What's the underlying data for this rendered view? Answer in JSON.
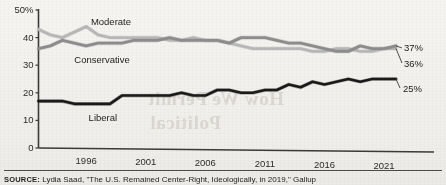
{
  "chart_data": {
    "type": "line",
    "title": "",
    "subtitle": "",
    "xlabel": "",
    "ylabel": "",
    "xlim": [
      1992,
      2022
    ],
    "ylim": [
      0,
      50
    ],
    "grid": false,
    "legend_position": "inline-annotations",
    "y_ticks": [
      "50%",
      "40",
      "30",
      "20",
      "10",
      "0"
    ],
    "y_tick_values": [
      50,
      40,
      30,
      20,
      10,
      0
    ],
    "x_ticks": [
      "1996",
      "2001",
      "2006",
      "2011",
      "2016",
      "2021"
    ],
    "x_tick_values": [
      1996,
      2001,
      2006,
      2011,
      2016,
      2021
    ],
    "x": [
      1992,
      1993,
      1994,
      1995,
      1996,
      1997,
      1998,
      1999,
      2000,
      2001,
      2002,
      2003,
      2004,
      2005,
      2006,
      2007,
      2008,
      2009,
      2010,
      2011,
      2012,
      2013,
      2014,
      2015,
      2016,
      2017,
      2018,
      2019,
      2020,
      2021,
      2022
    ],
    "series": [
      {
        "name": "Moderate",
        "color": "#b7b7b7",
        "end_label": "36%",
        "label_x": 1996.4,
        "label_y": 45.5,
        "values": [
          43,
          41,
          40,
          42,
          44,
          41,
          40,
          40,
          40,
          40,
          40,
          39,
          39,
          40,
          39,
          39,
          38,
          37,
          36,
          36,
          36,
          36,
          36,
          35,
          35,
          36,
          36,
          35,
          35,
          36,
          36
        ]
      },
      {
        "name": "Conservative",
        "color": "#8c8c8c",
        "end_label": "37%",
        "label_x": 1995.0,
        "label_y": 32.0,
        "values": [
          36,
          37,
          39,
          38,
          37,
          38,
          38,
          38,
          39,
          39,
          39,
          40,
          39,
          39,
          39,
          39,
          38,
          40,
          40,
          40,
          39,
          38,
          38,
          37,
          36,
          35,
          35,
          37,
          36,
          36,
          37
        ]
      },
      {
        "name": "Liberal",
        "color": "#1a1a1a",
        "end_label": "25%",
        "label_x": 1996.2,
        "label_y": 11.0,
        "values": [
          17,
          17,
          17,
          16,
          16,
          16,
          16,
          19,
          19,
          19,
          19,
          19,
          20,
          19,
          19,
          21,
          21,
          20,
          20,
          21,
          21,
          23,
          22,
          24,
          23,
          24,
          25,
          24,
          25,
          25,
          25
        ]
      }
    ]
  },
  "source": {
    "prefix": "SOURCE:",
    "text": "Lydia Saad, \"The U.S. Remained Center-Right, Ideologically, in 2019,\" Gallup"
  },
  "bleed_through": {
    "line1": "How We Permit",
    "line2": "Political",
    "line3": "reverse page text"
  }
}
